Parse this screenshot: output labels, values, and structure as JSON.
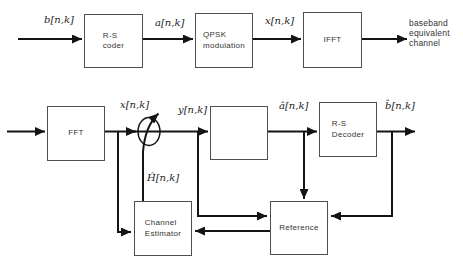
{
  "colors": {
    "line": "#141414",
    "box_border": "#4f4f4f",
    "background": "#ffffff",
    "text": "#333333"
  },
  "blocks": {
    "rs_coder": "R-S\ncoder",
    "qpsk": "QPSK\nmodulation",
    "ifft": "IFFT",
    "fft": "FFT",
    "rs_decoder": "R-S\nDecoder",
    "channel_estimator": "Channel\nEstimator",
    "reference": "Reference"
  },
  "signals": {
    "b": "b[n,k]",
    "a": "a[n,k]",
    "x_top": "x[n,k]",
    "x": "x[n,k]",
    "y": "y[n,k]",
    "a_hat": "â[n,k]",
    "b_hat": "b̂[n,k]",
    "h_hat": "Ĥ[n,k]"
  },
  "annotations": {
    "output_channel": "baseband\nequivalent\nchannel"
  },
  "icons": {
    "multiplier": "equalizer-multiplier-circle-with-arrow",
    "slicer": "hard-decision-slicer-step-symbol"
  }
}
